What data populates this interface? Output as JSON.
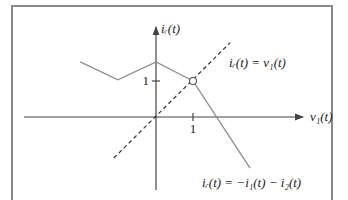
{
  "diagram": {
    "axes": {
      "x_label": "v₁(t)",
      "y_label": "iᵣ(t)",
      "x_tick_label": "1",
      "y_tick_label": "1",
      "x_tick_value": 1,
      "y_tick_value": 1
    },
    "curves": {
      "characteristic": {
        "label": "iᵣ(t) = −i₁(t) − i₂(t)",
        "style": "solid",
        "color": "#8c8c8c",
        "points": [
          [
            -2.05,
            1.53
          ],
          [
            -1.03,
            1.03
          ],
          [
            0,
            1.53
          ],
          [
            1,
            1
          ],
          [
            2.54,
            -1.42
          ]
        ]
      },
      "load_line": {
        "label": "iᵣ(t) = v₁(t)",
        "style": "dashed",
        "color": "#333333",
        "points": [
          [
            -1.14,
            -1.14
          ],
          [
            2.0,
            2.06
          ]
        ]
      }
    },
    "operating_point": {
      "x": 1,
      "y": 1,
      "marker": "open-circle"
    },
    "colors": {
      "axis": "#444444",
      "frame": "#8a8a8a"
    }
  }
}
